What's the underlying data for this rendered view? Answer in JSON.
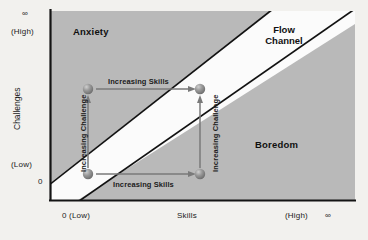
{
  "diagram": {
    "plot_background_color": "#b8b8b8",
    "channel_color": "#ffffff",
    "line_color": "#111111",
    "page_background_color": "#f2f1ee",
    "sphere_color": "#8a8a8a",
    "arrow_color": "#6e6e6e"
  },
  "axes": {
    "y": {
      "title": "Challenges",
      "top_infinity": "∞",
      "top_label": "(High)",
      "bottom_label": "(Low)",
      "zero": "0"
    },
    "x": {
      "title": "Skills",
      "origin_label": "0 (Low)",
      "high_label": "(High)",
      "right_infinity": "∞"
    }
  },
  "regions": [
    {
      "name": "anxiety",
      "label": "Anxiety"
    },
    {
      "name": "boredom",
      "label": "Boredom"
    },
    {
      "name": "flow-channel",
      "label_line1": "Flow",
      "label_line2": "Channel"
    }
  ],
  "arrows": [
    {
      "name": "increasing-skills-top",
      "label": "Increasing Skills",
      "direction": "horizontal"
    },
    {
      "name": "increasing-skills-bottom",
      "label": "Increasing Skills",
      "direction": "horizontal"
    },
    {
      "name": "increasing-challenge-left",
      "label": "Increasing Challenge",
      "direction": "vertical"
    },
    {
      "name": "increasing-challenge-right",
      "label": "Increasing Challenge",
      "direction": "vertical"
    }
  ],
  "markers": [
    {
      "name": "state-low-skill-high-challenge",
      "x": 88,
      "y": 89
    },
    {
      "name": "state-high-skill-high-challenge",
      "x": 200,
      "y": 89
    },
    {
      "name": "state-low-skill-low-challenge",
      "x": 88,
      "y": 174
    },
    {
      "name": "state-high-skill-low-challenge",
      "x": 200,
      "y": 174
    }
  ]
}
